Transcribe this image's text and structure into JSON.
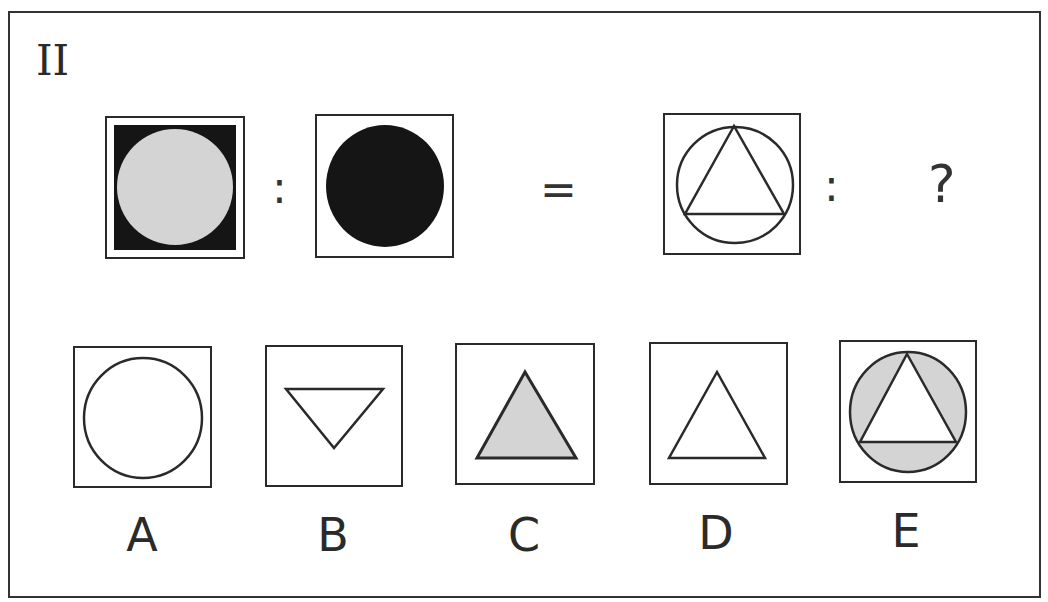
{
  "puzzle": {
    "number": "II",
    "colon": ":",
    "equals": "=",
    "question": "?",
    "colors": {
      "stroke": "#2a2a2a",
      "gray_fill": "#d4d4d4",
      "black_fill": "#151515"
    },
    "analogy": [
      {
        "name": "gray-circle-on-black-square"
      },
      {
        "name": "black-circle"
      },
      {
        "name": "triangle-inscribed-in-circle"
      }
    ],
    "options": [
      {
        "label": "A",
        "shape": "circle-outline"
      },
      {
        "label": "B",
        "shape": "inverted-triangle-outline"
      },
      {
        "label": "C",
        "shape": "gray-triangle"
      },
      {
        "label": "D",
        "shape": "triangle-outline"
      },
      {
        "label": "E",
        "shape": "triangle-in-gray-circle"
      }
    ]
  }
}
